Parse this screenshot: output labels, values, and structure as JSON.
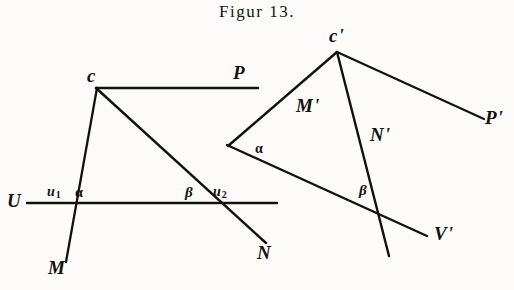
{
  "figure": {
    "title": "Figur 13.",
    "ink_color": "#14100d",
    "paper_color": "#fdfcfa",
    "width": 514,
    "height": 290
  },
  "left_diagram": {
    "name": "original-angle-construction",
    "apex_label": "c",
    "labels": {
      "line_p": "P",
      "line_u": "U",
      "point_u1": "u",
      "point_u1_sub": "1",
      "point_u2": "u",
      "point_u2_sub": "2",
      "angle_alpha": "α",
      "angle_beta": "β",
      "ray_m": "M",
      "ray_n": "N"
    },
    "geometry": {
      "apex": [
        96,
        88
      ],
      "line_p": [
        [
          96,
          88
        ],
        [
          258,
          88
        ]
      ],
      "line_u": [
        [
          27,
          203
        ],
        [
          277,
          203
        ]
      ],
      "ray_m": [
        [
          96,
          88
        ],
        [
          66,
          262
        ]
      ],
      "ray_n": [
        [
          96,
          88
        ],
        [
          266,
          243
        ]
      ],
      "point_u1": [
        74,
        201
      ],
      "point_u2": [
        215,
        203
      ]
    }
  },
  "right_diagram": {
    "name": "transformed-angle-construction",
    "apex_label": "c",
    "apex_prime": "'",
    "labels": {
      "ray_m_prime": "M",
      "ray_n_prime": "N",
      "ray_p_prime": "P",
      "line_v_prime": "V",
      "prime_mark": "'",
      "angle_alpha": "α",
      "angle_beta": "β"
    },
    "geometry": {
      "apex": [
        337,
        52
      ],
      "ray_m_prime": [
        [
          337,
          52
        ],
        [
          228,
          146
        ]
      ],
      "ray_n_prime": [
        [
          337,
          52
        ],
        [
          389,
          256
        ]
      ],
      "ray_p_prime": [
        [
          337,
          52
        ],
        [
          484,
          119
        ]
      ],
      "line_v_prime": [
        [
          227,
          145
        ],
        [
          427,
          236
        ]
      ],
      "intersection_alpha": [
        245,
        152
      ],
      "intersection_beta": [
        376,
        212
      ]
    }
  }
}
